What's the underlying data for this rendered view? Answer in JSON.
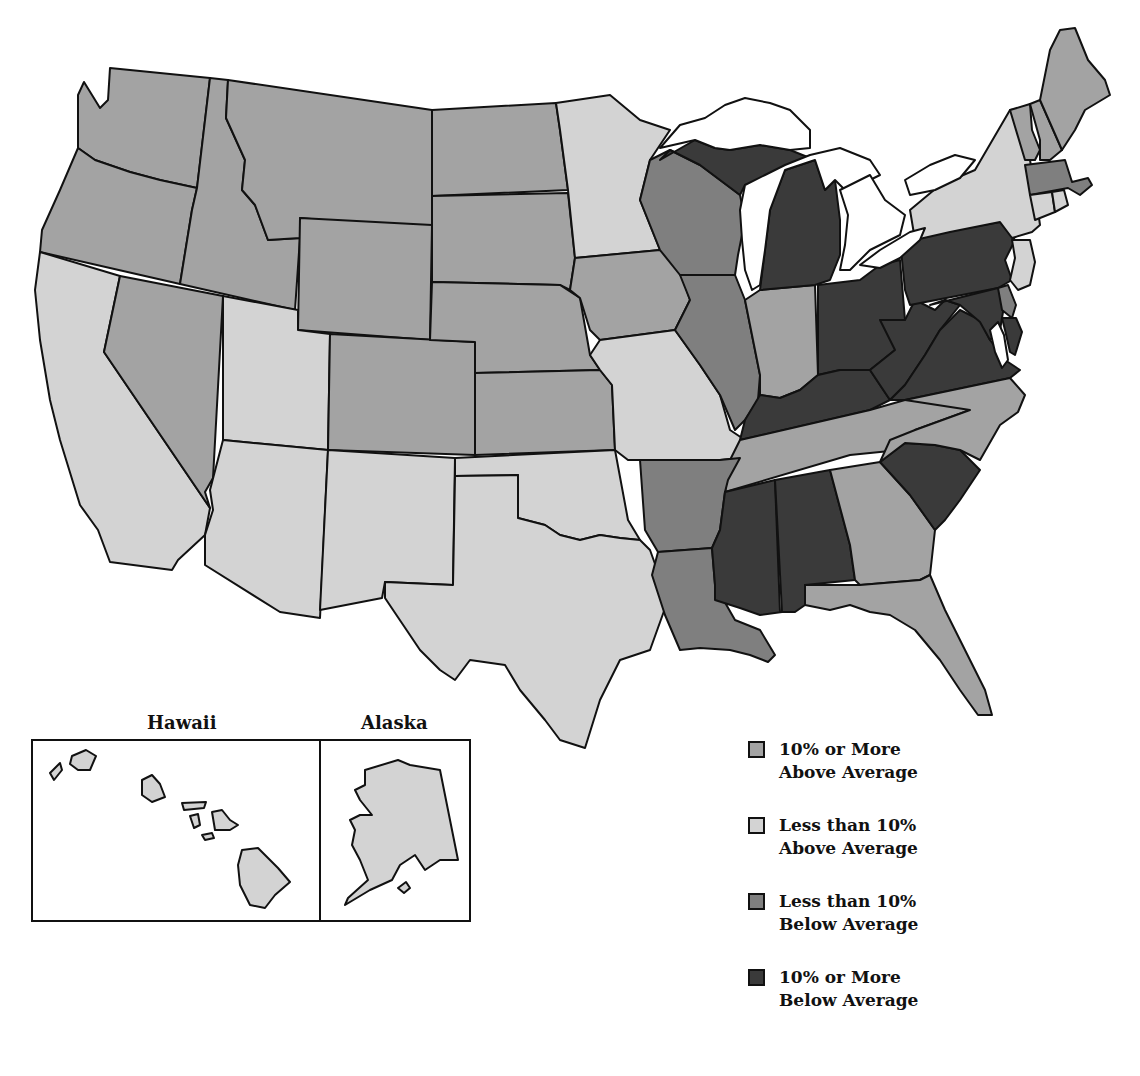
{
  "map": {
    "title": "",
    "categories": [
      {
        "id": "above10",
        "label_line1": "10% or More",
        "label_line2": "Above Average",
        "color": "#a3a3a3"
      },
      {
        "id": "above_lt10",
        "label_line1": "Less than 10%",
        "label_line2": "Above Average",
        "color": "#d3d3d3"
      },
      {
        "id": "below_lt10",
        "label_line1": "Less than 10%",
        "label_line2": "Below Average",
        "color": "#7f7f7f"
      },
      {
        "id": "below10",
        "label_line1": "10% or More",
        "label_line2": "Below Average",
        "color": "#3a3a3a"
      }
    ],
    "states": {
      "Washington": "above10",
      "Oregon": "above10",
      "Idaho": "above10",
      "Montana": "above10",
      "Wyoming": "above10",
      "Nevada": "above10",
      "Colorado": "above10",
      "North Dakota": "above10",
      "South Dakota": "above10",
      "Nebraska": "above10",
      "Kansas": "above10",
      "Iowa": "above10",
      "Indiana": "above10",
      "Georgia": "above10",
      "Florida": "above10",
      "North Carolina": "above10",
      "Tennessee": "above10",
      "Maine": "above10",
      "New Hampshire": "above10",
      "Vermont": "above10",
      "California": "above_lt10",
      "Utah": "above_lt10",
      "Arizona": "above_lt10",
      "New Mexico": "above_lt10",
      "Texas": "above_lt10",
      "Oklahoma": "above_lt10",
      "Minnesota": "above_lt10",
      "Missouri": "above_lt10",
      "New York": "above_lt10",
      "New Jersey": "above_lt10",
      "Connecticut": "above_lt10",
      "Rhode Island": "above_lt10",
      "Hawaii": "above_lt10",
      "Alaska": "above_lt10",
      "Wisconsin": "below_lt10",
      "Illinois": "below_lt10",
      "Arkansas": "below_lt10",
      "Louisiana": "below_lt10",
      "Massachusetts": "below_lt10",
      "Delaware": "below_lt10",
      "Michigan": "below10",
      "Ohio": "below10",
      "Kentucky": "below10",
      "West Virginia": "below10",
      "Virginia": "below10",
      "Pennsylvania": "below10",
      "Maryland": "below10",
      "Mississippi": "below10",
      "Alabama": "below10",
      "South Carolina": "below10"
    }
  },
  "insets": {
    "hawaii_label": "Hawaii",
    "alaska_label": "Alaska"
  },
  "legend": {
    "items": [
      {
        "line1": "10% or More",
        "line2": "Above Average",
        "color": "#a3a3a3"
      },
      {
        "line1": "Less than 10%",
        "line2": "Above Average",
        "color": "#d3d3d3"
      },
      {
        "line1": "Less than 10%",
        "line2": "Below Average",
        "color": "#7f7f7f"
      },
      {
        "line1": "10% or More",
        "line2": "Below Average",
        "color": "#3a3a3a"
      }
    ]
  }
}
